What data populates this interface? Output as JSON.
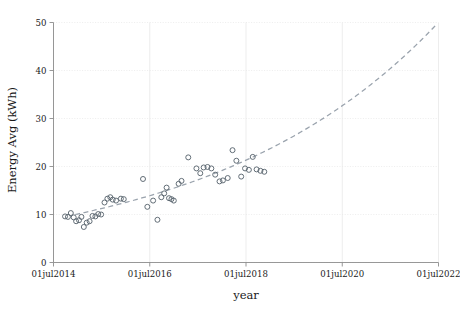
{
  "chart_data": {
    "type": "scatter",
    "title": "",
    "xlabel": "year",
    "ylabel": "Energy Avg (kWh)",
    "xlim": [
      2014.5,
      2022.5
    ],
    "ylim": [
      0,
      50
    ],
    "grid": true,
    "legend": false,
    "x_tick_labels": [
      "01jul2014",
      "01jul2016",
      "01jul2018",
      "01jul2020",
      "01jul2022"
    ],
    "x_tick_values": [
      2014.5,
      2016.5,
      2018.5,
      2020.5,
      2022.5
    ],
    "y_tick_labels": [
      "0",
      "10",
      "20",
      "30",
      "40",
      "50"
    ],
    "y_tick_values": [
      0,
      10,
      20,
      30,
      40,
      50
    ],
    "series": [
      {
        "name": "Energy Avg observations",
        "marker": "open-circle",
        "color": "#5b6670",
        "points": [
          [
            2014.74,
            9.6
          ],
          [
            2014.8,
            9.5
          ],
          [
            2014.86,
            10.3
          ],
          [
            2014.92,
            9.4
          ],
          [
            2014.97,
            8.6
          ],
          [
            2015.03,
            8.8
          ],
          [
            2015.08,
            9.5
          ],
          [
            2015.13,
            7.4
          ],
          [
            2015.19,
            8.3
          ],
          [
            2015.25,
            8.6
          ],
          [
            2015.31,
            9.7
          ],
          [
            2015.37,
            9.6
          ],
          [
            2015.43,
            10.1
          ],
          [
            2015.49,
            10.0
          ],
          [
            2015.56,
            12.5
          ],
          [
            2015.62,
            13.3
          ],
          [
            2015.68,
            13.6
          ],
          [
            2015.73,
            13.1
          ],
          [
            2015.8,
            12.9
          ],
          [
            2015.9,
            13.3
          ],
          [
            2015.96,
            13.2
          ],
          [
            2016.36,
            17.4
          ],
          [
            2016.45,
            11.6
          ],
          [
            2016.57,
            12.9
          ],
          [
            2016.66,
            8.9
          ],
          [
            2016.74,
            13.6
          ],
          [
            2016.8,
            14.4
          ],
          [
            2016.85,
            15.6
          ],
          [
            2016.9,
            13.4
          ],
          [
            2016.95,
            13.2
          ],
          [
            2017.0,
            12.9
          ],
          [
            2017.1,
            16.4
          ],
          [
            2017.16,
            17.0
          ],
          [
            2017.3,
            21.9
          ],
          [
            2017.47,
            19.6
          ],
          [
            2017.55,
            18.6
          ],
          [
            2017.62,
            19.8
          ],
          [
            2017.7,
            19.9
          ],
          [
            2017.78,
            19.6
          ],
          [
            2017.86,
            18.3
          ],
          [
            2017.95,
            16.9
          ],
          [
            2018.02,
            17.1
          ],
          [
            2018.12,
            17.6
          ],
          [
            2018.22,
            23.4
          ],
          [
            2018.3,
            21.2
          ],
          [
            2018.4,
            17.9
          ],
          [
            2018.48,
            19.6
          ],
          [
            2018.56,
            19.3
          ],
          [
            2018.64,
            22.0
          ],
          [
            2018.72,
            19.4
          ],
          [
            2018.8,
            19.1
          ],
          [
            2018.88,
            18.9
          ]
        ]
      }
    ],
    "fit": {
      "name": "exponential trend",
      "style": "dashed",
      "color": "#9aa3ad",
      "x_start": 2014.95,
      "x_end": 2022.45,
      "y_start": 10.0,
      "y_end": 49.5,
      "model": "exponential"
    }
  }
}
